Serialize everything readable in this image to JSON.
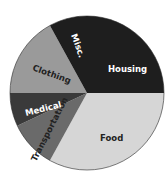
{
  "chart_data": {
    "type": "pie",
    "title": "",
    "categories": [
      "Housing",
      "Food",
      "Transportation",
      "Medical",
      "Clothing",
      "Misc."
    ],
    "values": [
      25,
      33,
      10,
      7,
      17,
      8
    ],
    "colors": [
      "#1e1e1e",
      "#d6d6d6",
      "#6a6a6a",
      "#3a3a3a",
      "#9a9a9a",
      "#1e1e1e"
    ],
    "label_colors": [
      "#ffffff",
      "#222222",
      "#222222",
      "#ffffff",
      "#222222",
      "#ffffff"
    ],
    "start_angle_deg": 0,
    "direction": "clockwise",
    "legend": "none (labels inside slices)"
  },
  "labels": {
    "housing": "Housing",
    "food": "Food",
    "transportation": "Transportation",
    "medical": "Medical",
    "clothing": "Clothing",
    "misc": "Misc."
  }
}
